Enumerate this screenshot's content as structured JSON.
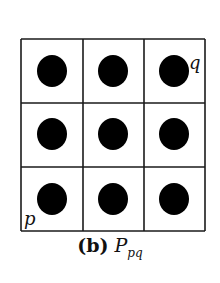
{
  "figure": {
    "grid": {
      "rows": 3,
      "cols": 3,
      "left": 21,
      "top": 39,
      "right": 205,
      "bottom": 231,
      "col_lines": [
        83,
        144
      ],
      "row_lines": [
        103,
        167
      ],
      "line_color": "#1a1a1a",
      "dot_color": "#000000"
    },
    "dots": [
      {
        "cx": 52,
        "cy": 71
      },
      {
        "cx": 113,
        "cy": 71
      },
      {
        "cx": 174,
        "cy": 71
      },
      {
        "cx": 52,
        "cy": 134
      },
      {
        "cx": 113,
        "cy": 134
      },
      {
        "cx": 174,
        "cy": 134
      },
      {
        "cx": 52,
        "cy": 199
      },
      {
        "cx": 113,
        "cy": 199
      },
      {
        "cx": 174,
        "cy": 199
      }
    ],
    "labels": {
      "q": "q",
      "p": "p"
    },
    "caption": {
      "prefix": "(b)",
      "symbol": "P",
      "subscript": "pq"
    }
  }
}
